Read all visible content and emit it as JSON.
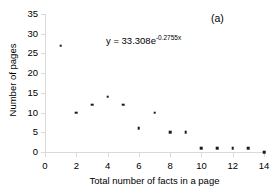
{
  "chart_data": {
    "type": "scatter",
    "title": "",
    "panel_label": "(a)",
    "xlabel": "Total number of facts in a page",
    "ylabel": "Number of pages",
    "x": [
      1,
      2,
      3,
      4,
      5,
      6,
      7,
      8,
      9,
      10,
      11,
      12,
      13,
      14
    ],
    "values": [
      27,
      10,
      12,
      14,
      12,
      6,
      10,
      5,
      5,
      1,
      1,
      1,
      1,
      0
    ],
    "series": [
      {
        "name": "Number of pages",
        "values": [
          27,
          10,
          12,
          14,
          12,
          6,
          10,
          5,
          5,
          1,
          1,
          1,
          1,
          0
        ]
      }
    ],
    "xlim": [
      0,
      14
    ],
    "ylim": [
      0,
      35
    ],
    "xticks": [
      0,
      2,
      4,
      6,
      8,
      10,
      12,
      14
    ],
    "yticks": [
      0,
      5,
      10,
      15,
      20,
      25,
      30,
      35
    ],
    "grid": false,
    "legend": false,
    "marker_color": "#1a1a1a",
    "axis_color": "#d9d9d9",
    "annotations": [
      {
        "name": "fit-equation",
        "prefix": "y = 33.308e",
        "exponent": "-0.2755x",
        "full_text": "y = 33.308e^-0.2755x"
      }
    ]
  }
}
